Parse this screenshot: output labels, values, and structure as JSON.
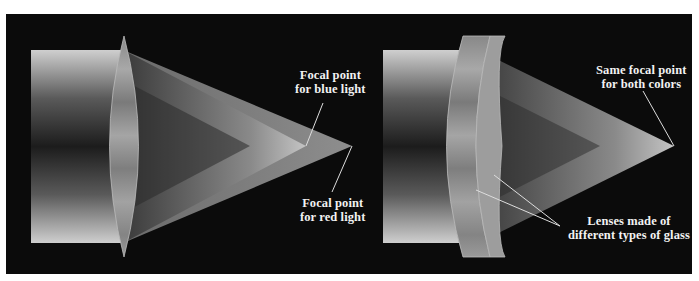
{
  "diagram": {
    "left_panel": {
      "name": "Single lens (chromatic aberration)",
      "labels": {
        "blue_focal": [
          "Focal point",
          "for blue light"
        ],
        "red_focal": [
          "Focal point",
          "for red light"
        ]
      }
    },
    "right_panel": {
      "name": "Compound achromatic lens",
      "labels": {
        "same_focal": [
          "Same focal point",
          "for both colors"
        ],
        "lenses": [
          "Lenses made of",
          "different types of glass"
        ]
      }
    },
    "colors": {
      "background": "#0b0b0b",
      "beam_light": "#c8c8c8",
      "beam_dark": "#1a1a1a",
      "lens": "#9a9a9a",
      "label_text": "#f2f2f2"
    }
  }
}
